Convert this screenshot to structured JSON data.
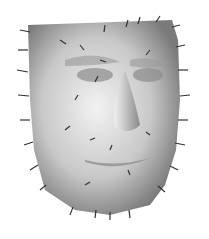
{
  "image": {
    "subject": "3D face mesh with displacement vector arrows",
    "background": "#ffffff",
    "mesh_color_light": "#e8e8e8",
    "mesh_color_dark": "#6a6a6a",
    "arrow_color": "#333333"
  }
}
